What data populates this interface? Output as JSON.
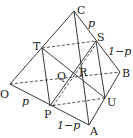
{
  "diagram": {
    "type": "tetrahedron-cross-section",
    "vertices": {
      "O": {
        "label": "O",
        "x": 10,
        "y": 84
      },
      "A": {
        "label": "A",
        "x": 89,
        "y": 125
      },
      "B": {
        "label": "B",
        "x": 120,
        "y": 72
      },
      "C": {
        "label": "C",
        "x": 74,
        "y": 11
      }
    },
    "points": {
      "P": {
        "label": "P",
        "x": 50,
        "y": 106
      },
      "U": {
        "label": "U",
        "x": 105,
        "y": 98
      },
      "S": {
        "label": "S",
        "x": 96,
        "y": 41
      },
      "T": {
        "label": "T",
        "x": 42,
        "y": 48
      },
      "Q": {
        "label": "Q",
        "x": 68,
        "y": 79
      },
      "R": {
        "label": "R",
        "x": 77,
        "y": 76
      }
    },
    "edge_labels": {
      "CS": "p",
      "SB": "1−p",
      "OP": "p",
      "PA": "1−p"
    }
  }
}
